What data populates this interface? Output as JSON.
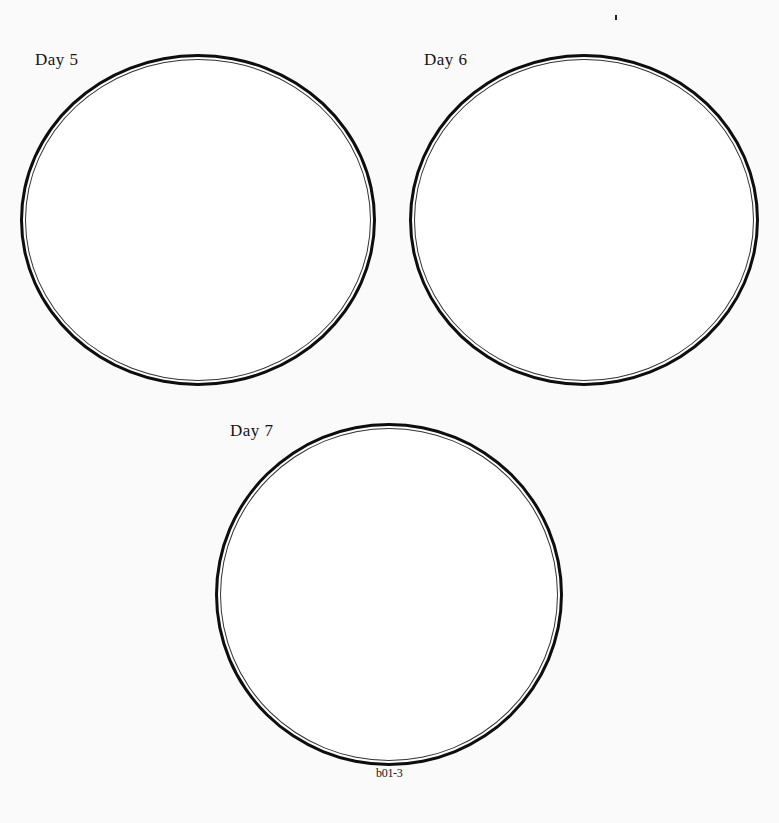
{
  "worksheet": {
    "circles": [
      {
        "label": "Day 5"
      },
      {
        "label": "Day 6"
      },
      {
        "label": "Day 7"
      }
    ],
    "footer_code": "b01-3"
  }
}
